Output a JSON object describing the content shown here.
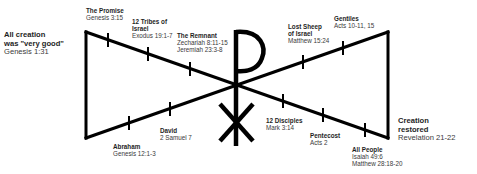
{
  "diagram": {
    "center_symbol": "chi-rho",
    "line_color": "#000000",
    "events": [
      {
        "id": "creation",
        "title": "All creation was \"very good\"",
        "title_lines": [
          "All creation",
          "was \"very good\""
        ],
        "refs": [
          "Genesis 1:31"
        ]
      },
      {
        "id": "promise",
        "title": "The Promise",
        "title_lines": [
          "The Promise"
        ],
        "refs": [
          "Genesis 3:15"
        ]
      },
      {
        "id": "abraham",
        "title": "Abraham",
        "title_lines": [
          "Abraham"
        ],
        "refs": [
          "Genesis 12:1-3"
        ]
      },
      {
        "id": "twelve-tribes",
        "title": "12 Tribes of Israel",
        "title_lines": [
          "12 Tribes of",
          "Israel"
        ],
        "refs": [
          "Exodus 19:1-7"
        ]
      },
      {
        "id": "david",
        "title": "David",
        "title_lines": [
          "David"
        ],
        "refs": [
          "2 Samuel 7"
        ]
      },
      {
        "id": "remnant",
        "title": "The Remnant",
        "title_lines": [
          "The Remnant"
        ],
        "refs": [
          "Zechariah 8:11-15",
          "Jeremiah  23:3-8"
        ]
      },
      {
        "id": "twelve-disciples",
        "title": "12 Disciples",
        "title_lines": [
          "12 Disciples"
        ],
        "refs": [
          "Mark 3:14"
        ]
      },
      {
        "id": "lost-sheep",
        "title": "Lost Sheep of Israel",
        "title_lines": [
          "Lost Sheep",
          "of Israel"
        ],
        "refs": [
          "Matthew 15:24"
        ]
      },
      {
        "id": "pentecost",
        "title": "Pentecost",
        "title_lines": [
          "Pentecost"
        ],
        "refs": [
          "Acts 2"
        ]
      },
      {
        "id": "gentiles",
        "title": "Gentiles",
        "title_lines": [
          "Gentiles"
        ],
        "refs": [
          "Acts 10-11, 15"
        ]
      },
      {
        "id": "all-people",
        "title": "All People",
        "title_lines": [
          "All People"
        ],
        "refs": [
          "Isaiah 49:6",
          "Matthew 28:18-20"
        ]
      },
      {
        "id": "creation-restored",
        "title": "Creation restored",
        "title_lines": [
          "Creation",
          "restored"
        ],
        "refs": [
          "Revelation 21-22"
        ]
      }
    ]
  }
}
